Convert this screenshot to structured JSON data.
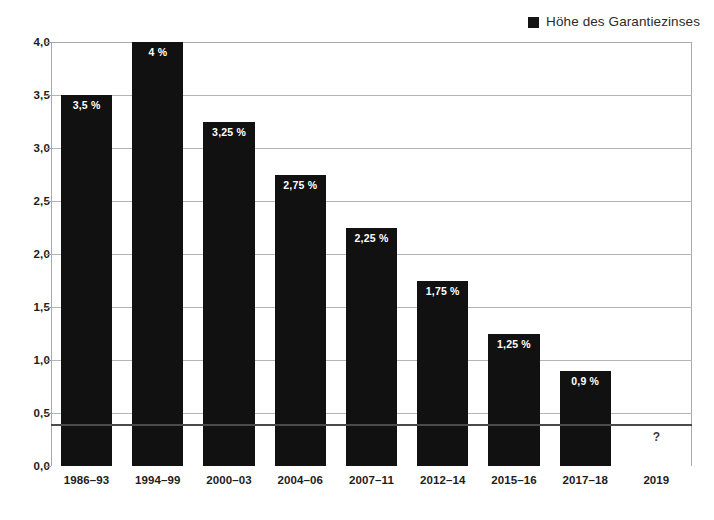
{
  "chart_data": {
    "type": "bar",
    "title": "",
    "subtitle": "",
    "xlabel": "",
    "ylabel": "",
    "categories": [
      "1986–93",
      "1994–99",
      "2000–03",
      "2004–06",
      "2007–11",
      "2012–14",
      "2015–16",
      "2017–18",
      "2019"
    ],
    "values": [
      3.5,
      4,
      3.25,
      2.75,
      2.25,
      1.75,
      1.25,
      0.9,
      null
    ],
    "data_labels": [
      "3,5 %",
      "4 %",
      "3,25 %",
      "2,75 %",
      "2,25 %",
      "1,75 %",
      "1,25 %",
      "0,9 %",
      "?"
    ],
    "unknown_marker": "?",
    "series": [
      {
        "name": "Höhe des Garantiezinses",
        "color": "#111111",
        "values": [
          3.5,
          4,
          3.25,
          2.75,
          2.25,
          1.75,
          1.25,
          0.9,
          null
        ]
      }
    ],
    "ylim": [
      0,
      4
    ],
    "yticks": [
      0,
      0.5,
      1,
      1.5,
      2,
      2.5,
      3,
      3.5,
      4
    ],
    "ytick_labels": [
      "0,0",
      "0,5",
      "1,0",
      "1,5",
      "2,0",
      "2,5",
      "3,0",
      "3,5",
      "4,0"
    ],
    "grid": true,
    "grid_axis": "y",
    "legend_position": "top-right"
  },
  "legend": {
    "entries": [
      {
        "label": "Höhe des Garantiezinses",
        "color": "#111111"
      }
    ]
  },
  "colors": {
    "bar": "#111111",
    "grid": "#b4b4b4",
    "axis": "#4a4a4a",
    "text": "#1d1d1d",
    "label_text": "#ffffff",
    "background": "#ffffff"
  }
}
